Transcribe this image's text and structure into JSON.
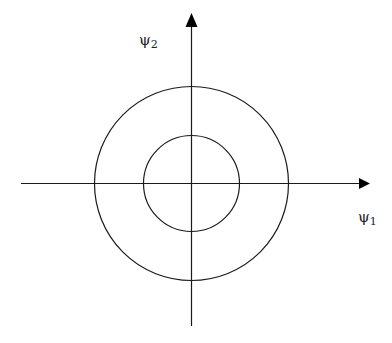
{
  "diagram": {
    "type": "concentric-circles-on-axes",
    "axes": {
      "x": {
        "symbol": "ψ",
        "subscript": "1",
        "label": "ψ1"
      },
      "y": {
        "symbol": "ψ",
        "subscript": "2",
        "label": "ψ2"
      }
    },
    "circles": [
      {
        "name": "inner",
        "relative_radius": 0.5
      },
      {
        "name": "outer",
        "relative_radius": 1.0
      }
    ],
    "colors": {
      "stroke": "#1a1a1a",
      "background": "#ffffff"
    }
  }
}
